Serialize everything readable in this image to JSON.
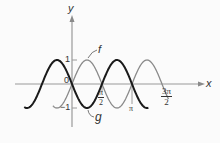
{
  "chart_data": {
    "type": "line",
    "title": "",
    "xlabel": "x",
    "ylabel": "y",
    "origin_label": "0",
    "y_ticks": [
      {
        "value": 1,
        "label": "1"
      },
      {
        "value": -1,
        "label": "-1"
      }
    ],
    "x_ticks": [
      {
        "value": 1.5708,
        "label_num": "π",
        "label_den": "2"
      },
      {
        "value": 3.1416,
        "label": "π"
      },
      {
        "value": 4.7124,
        "label_num": "3π",
        "label_den": "2"
      }
    ],
    "xlim": [
      -1.9,
      4.9
    ],
    "ylim": [
      -1.7,
      2.9
    ],
    "grid": false,
    "legend": "inline labels",
    "series": [
      {
        "name": "f",
        "formula": "sin(2x)",
        "x_range": [
          -1.0,
          5.05
        ],
        "style": "thin gray",
        "color": "#8a8a8a",
        "points": [
          [
            -0.785,
            -1
          ],
          [
            0,
            0
          ],
          [
            0.785,
            1
          ],
          [
            1.571,
            0
          ],
          [
            2.356,
            -1
          ],
          [
            3.142,
            0
          ],
          [
            3.927,
            1
          ],
          [
            4.712,
            0
          ]
        ]
      },
      {
        "name": "g",
        "formula": "-sin(2x)",
        "x_range": [
          -2.5,
          4.0
        ],
        "style": "bold black",
        "color": "#1a1a1a",
        "points": [
          [
            -2.356,
            -1
          ],
          [
            -1.571,
            0
          ],
          [
            -0.785,
            1
          ],
          [
            0,
            0
          ],
          [
            0.785,
            -1
          ],
          [
            1.571,
            0
          ],
          [
            2.356,
            1
          ],
          [
            3.142,
            0
          ]
        ]
      }
    ]
  },
  "labels": {
    "y_axis": "y",
    "x_axis": "x",
    "origin": "0",
    "one": "1",
    "neg_one": "−1",
    "f": "f",
    "g": "g",
    "half_pi_num": "π",
    "half_pi_den": "2",
    "pi": "π",
    "three_half_pi_num": "3π",
    "three_half_pi_den": "2"
  },
  "colors": {
    "axis": "#9a9a9a",
    "f": "#8a8a8a",
    "g": "#1a1a1a",
    "background": "#fbfbfb"
  }
}
